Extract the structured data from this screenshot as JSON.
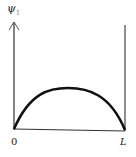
{
  "diagram": {
    "axis_label": "ψ",
    "axis_subscript": "1",
    "x_left_label": "0",
    "x_right_label": "L",
    "curve": "half sine arch from 0 to L",
    "colors": {
      "stroke": "#111111",
      "background": "#ffffff"
    }
  }
}
